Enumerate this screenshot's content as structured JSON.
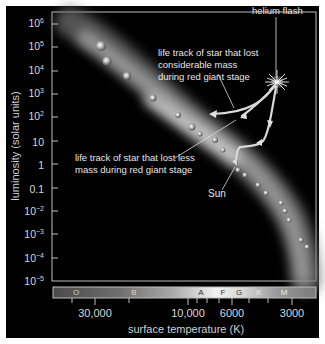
{
  "diagram": {
    "type": "Hertzsprung-Russell diagram",
    "y_axis": {
      "title": "luminosity (solar units)",
      "ticks": [
        {
          "base": "10",
          "exp": "6"
        },
        {
          "base": "10",
          "exp": "5"
        },
        {
          "base": "10",
          "exp": "4"
        },
        {
          "base": "10",
          "exp": "3"
        },
        {
          "base": "10",
          "exp": "2"
        },
        {
          "base": "10",
          "exp": ""
        },
        {
          "base": "1",
          "exp": ""
        },
        {
          "base": "0.1",
          "exp": ""
        },
        {
          "base": "10",
          "exp": "−2"
        },
        {
          "base": "10",
          "exp": "−3"
        },
        {
          "base": "10",
          "exp": "−4"
        },
        {
          "base": "10",
          "exp": "−5"
        }
      ]
    },
    "x_axis": {
      "title": "surface temperature (K)",
      "ticks": [
        "30,000",
        "10,000",
        "6000",
        "3000"
      ]
    },
    "spectral_classes": [
      "O",
      "B",
      "A",
      "F",
      "G",
      "K",
      "M"
    ],
    "annotations": {
      "helium_flash": "helium flash",
      "considerable_line1": "life track of star that lost",
      "considerable_line2": "considerable mass",
      "considerable_line3": "during red giant stage",
      "less_line1": "life track of star that lost less",
      "less_line2": "mass during red giant stage",
      "sun": "Sun"
    },
    "colors": {
      "background": "#000000",
      "frame_border": "#bdbdbd",
      "text": "#e0e0e0",
      "main_sequence": "#9a9a9a",
      "track": "#d0d0d0"
    }
  }
}
